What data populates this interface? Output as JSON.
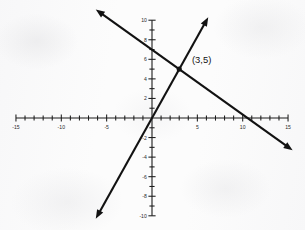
{
  "figure": {
    "background_color": "#fcfcfc",
    "ink_color": "#121212"
  },
  "chart_data": {
    "type": "line",
    "title": "",
    "subtitle": "",
    "xlabel": "",
    "ylabel": "",
    "xlim": [
      -15,
      15
    ],
    "ylim": [
      -10,
      10
    ],
    "grid": false,
    "legend": null,
    "x_tick_step": 1,
    "y_tick_step": 1,
    "x_labeled_ticks": [
      -15,
      -10,
      -5,
      5,
      10,
      15
    ],
    "y_labeled_ticks": [
      -10,
      -8,
      -6,
      -4,
      -2,
      2,
      4,
      6,
      8,
      10
    ],
    "x_tick_labels": [
      "-15",
      "-10",
      "-5",
      "5",
      "10",
      "15"
    ],
    "y_tick_labels": [
      "-10",
      "-8",
      "-6",
      "-4",
      "-2",
      "2",
      "4",
      "6",
      "8",
      "10"
    ],
    "series": [
      {
        "name": "steep-line",
        "slope": 1.667,
        "intercept": 0,
        "equation": "y = 5/3 x",
        "x": [
          -6.2,
          6.2
        ],
        "values": [
          -10.3,
          10.3
        ],
        "arrows": "both"
      },
      {
        "name": "shallow-line",
        "slope": -0.667,
        "intercept": 7,
        "equation": "y = -2/3 x + 7",
        "x": [
          -6.2,
          15.5
        ],
        "values": [
          11.1,
          -3.3
        ],
        "arrows": "both"
      }
    ],
    "annotations": [
      {
        "name": "intersection-point",
        "label": "(3,5)",
        "x": 3,
        "y": 5,
        "marker": "filled-dot"
      }
    ]
  }
}
